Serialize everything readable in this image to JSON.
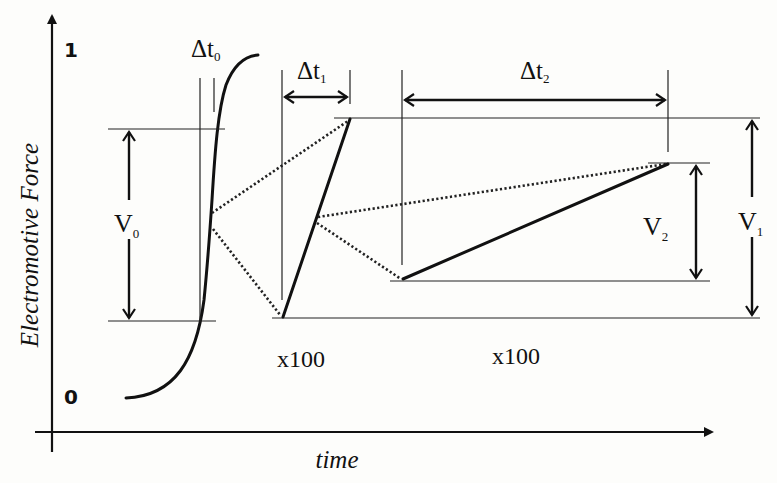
{
  "diagram": {
    "y_axis": {
      "label": "Electromotive Force",
      "tick_top": "1",
      "tick_bottom": "0"
    },
    "x_axis": {
      "label": "time"
    },
    "intervals": {
      "dt0": {
        "symbol": "Δt",
        "subscript": "0"
      },
      "dt1": {
        "symbol": "Δt",
        "subscript": "1"
      },
      "dt2": {
        "symbol": "Δt",
        "subscript": "2"
      }
    },
    "voltages": {
      "v0": {
        "symbol": "V",
        "subscript": "0"
      },
      "v1": {
        "symbol": "V",
        "subscript": "1"
      },
      "v2": {
        "symbol": "V",
        "subscript": "2"
      }
    },
    "magnifications": {
      "first": "x100",
      "second": "x100"
    }
  }
}
